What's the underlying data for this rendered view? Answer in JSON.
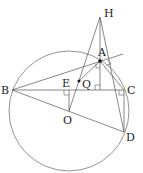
{
  "diagram": {
    "type": "geometry",
    "points": {
      "H": {
        "label": "H",
        "x": 100,
        "y": 17,
        "lx": 104,
        "ly": 17
      },
      "A": {
        "label": "A",
        "x": 100,
        "y": 61,
        "lx": 100,
        "ly": 57
      },
      "B": {
        "label": "B",
        "x": 12,
        "y": 90,
        "lx": 1,
        "ly": 94
      },
      "C": {
        "label": "C",
        "x": 124,
        "y": 90,
        "lx": 128,
        "ly": 94
      },
      "D": {
        "label": "D",
        "x": 124,
        "y": 132,
        "lx": 127,
        "ly": 140
      },
      "E": {
        "label": "E",
        "x": 69,
        "y": 90,
        "lx": 62,
        "ly": 87
      },
      "O": {
        "label": "O",
        "x": 69,
        "y": 111,
        "lx": 63,
        "ly": 124
      },
      "Q": {
        "label": "Q",
        "x": 79,
        "y": 81,
        "lx": 82,
        "ly": 88
      }
    },
    "circle": {
      "center": "O",
      "cx": 69,
      "cy": 111,
      "r": 60
    },
    "segments": [
      "HA",
      "HB?",
      "HO",
      "HD",
      "AB",
      "AC",
      "BC",
      "BD",
      "CD",
      "OE",
      "AQ",
      "AE"
    ],
    "right_angles": [
      "at E (OE ⊥ BC)",
      "at foot of H on BC",
      "at C (CD ⊥ BC)",
      "at A",
      "near A on tangent"
    ],
    "marked_points": [
      "A",
      "Q"
    ]
  }
}
